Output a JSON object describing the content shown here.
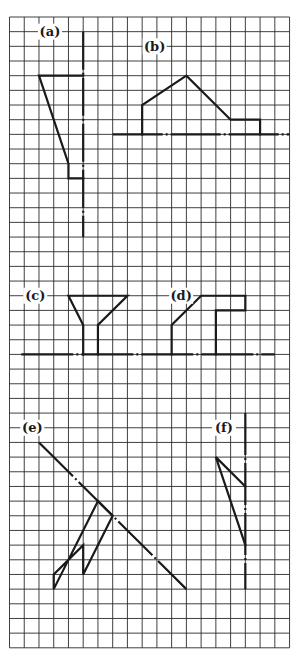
{
  "grid": {
    "origin_x": 9.5,
    "origin_y": 17,
    "cell_w": 14.74,
    "cell_h": 14.67,
    "cols": 19,
    "rows": 43,
    "line_color": "#2a2a2a"
  },
  "ink_color": "#1a1a1a",
  "figures": [
    {
      "id": "a",
      "label": "(a)",
      "label_pos": [
        2,
        1
      ],
      "centerline": {
        "from": [
          5,
          1
        ],
        "to": [
          5,
          15
        ],
        "pattern": "38 3 2 3"
      },
      "polyline": [
        [
          5,
          4
        ],
        [
          2,
          4
        ],
        [
          4,
          10
        ],
        [
          4,
          11
        ],
        [
          5,
          11
        ]
      ]
    },
    {
      "id": "b",
      "label": "(b)",
      "label_pos": [
        9.1,
        2
      ],
      "centerline": {
        "from": [
          7,
          8
        ],
        "to": [
          19,
          8
        ],
        "pattern": "50 3 2 3"
      },
      "polyline": [
        [
          9,
          8
        ],
        [
          9,
          6
        ],
        [
          12,
          4
        ],
        [
          15,
          7
        ],
        [
          17,
          7
        ],
        [
          17,
          8
        ]
      ]
    },
    {
      "id": "c",
      "label": "(c)",
      "label_pos": [
        1,
        19
      ],
      "centerline": {
        "from": [
          0.8,
          23
        ],
        "to": [
          18,
          23
        ],
        "pattern": "52 3 2 3"
      },
      "polyline": [
        [
          5,
          23
        ],
        [
          5,
          21
        ],
        [
          4,
          19
        ],
        [
          8,
          19
        ],
        [
          6,
          21
        ],
        [
          6,
          23
        ]
      ]
    },
    {
      "id": "d",
      "label": "(d)",
      "label_pos": [
        10.9,
        19
      ],
      "centerline": null,
      "polyline": [
        [
          11,
          23
        ],
        [
          11,
          21
        ],
        [
          13,
          19
        ],
        [
          16,
          19
        ],
        [
          16,
          20
        ],
        [
          14,
          20
        ],
        [
          14,
          23
        ]
      ]
    },
    {
      "id": "e",
      "label": "(e)",
      "label_pos": [
        0.8,
        28
      ],
      "centerline": {
        "from": [
          2,
          29
        ],
        "to": [
          12,
          39
        ],
        "pattern": "48 3 2 3"
      },
      "polyline": [
        [
          6,
          33
        ],
        [
          7,
          34
        ],
        [
          5,
          38
        ],
        [
          5,
          36
        ],
        [
          3,
          38
        ],
        [
          3,
          39
        ],
        [
          6,
          33
        ]
      ]
    },
    {
      "id": "f",
      "label": "(f)",
      "label_pos": [
        13.8,
        28
      ],
      "centerline": {
        "from": [
          16,
          27
        ],
        "to": [
          16,
          39
        ],
        "pattern": "42 3 2 3"
      },
      "polyline": [
        [
          16,
          32
        ],
        [
          14,
          30
        ],
        [
          16,
          36
        ]
      ]
    }
  ]
}
